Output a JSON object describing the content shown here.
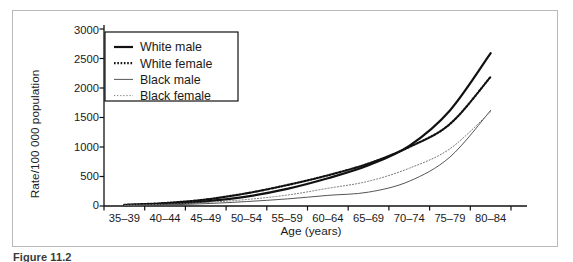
{
  "figure": {
    "caption": "Figure 11.2",
    "frame_color": "#b9b9b9"
  },
  "chart_data": {
    "type": "line",
    "title": "",
    "xlabel": "Age (years)",
    "ylabel": "Rate/100 000 population",
    "categories": [
      "35–39",
      "40–44",
      "45–49",
      "50–54",
      "55–59",
      "60–64",
      "65–69",
      "70–74",
      "75–79",
      "80–84"
    ],
    "xtick_labels": [
      "35–39",
      "40–44",
      "45–49",
      "50–54",
      "55–59",
      "60–64",
      "65–69",
      "70–74",
      "75–79",
      "80–84"
    ],
    "ytick_labels": [
      "0",
      "500",
      "1000",
      "1500",
      "2000",
      "2500",
      "3000"
    ],
    "yticks": [
      0,
      500,
      1000,
      1500,
      2000,
      2500,
      3000
    ],
    "ylim": [
      0,
      3000
    ],
    "grid": false,
    "legend_position": "upper-left",
    "series": [
      {
        "name": "White male",
        "style": "solid",
        "width": 2.2,
        "color": "#111111",
        "values": [
          15,
          35,
          80,
          160,
          290,
          470,
          690,
          1020,
          1620,
          2590
        ]
      },
      {
        "name": "White female",
        "style": "dotted",
        "width": 2.2,
        "color": "#111111",
        "values": [
          20,
          50,
          110,
          215,
          355,
          520,
          720,
          1000,
          1390,
          2190
        ]
      },
      {
        "name": "Black male",
        "style": "solid",
        "width": 1.0,
        "color": "#555555",
        "values": [
          8,
          18,
          40,
          75,
          120,
          180,
          235,
          420,
          830,
          1620
        ]
      },
      {
        "name": "Black female",
        "style": "dotted",
        "width": 1.0,
        "color": "#777777",
        "values": [
          12,
          28,
          60,
          110,
          185,
          300,
          420,
          640,
          970,
          1600
        ]
      }
    ]
  },
  "legend": {
    "items": [
      {
        "label": "White male"
      },
      {
        "label": "White female"
      },
      {
        "label": "Black male"
      },
      {
        "label": "Black female"
      }
    ]
  }
}
